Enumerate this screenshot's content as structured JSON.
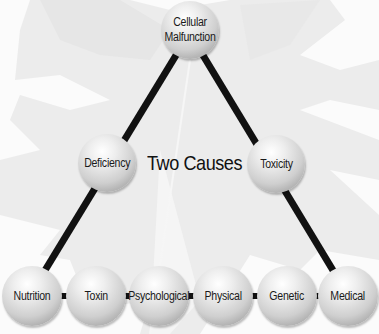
{
  "diagram": {
    "title": "Two Causes",
    "top_node": {
      "label": "Cellular\nMalfunction"
    },
    "cause_nodes": [
      {
        "label": "Deficiency"
      },
      {
        "label": "Toxicity"
      }
    ],
    "bottom_nodes": [
      {
        "label": "Nutrition"
      },
      {
        "label": "Toxin"
      },
      {
        "label": "Psychological"
      },
      {
        "label": "Physical"
      },
      {
        "label": "Genetic"
      },
      {
        "label": "Medical"
      }
    ],
    "colors": {
      "line": "#111111",
      "sphere_light": "#ffffff",
      "sphere_dark": "#8a8a8a",
      "background": "#f2f2f2"
    }
  }
}
